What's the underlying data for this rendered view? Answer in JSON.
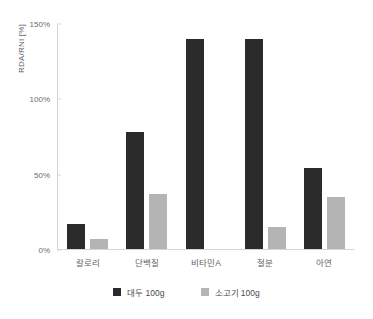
{
  "chart_data": {
    "type": "bar",
    "title": "",
    "subtitle": "",
    "xlabel": "",
    "ylabel": "RDA/RNI [%]",
    "categories": [
      "칼로리",
      "단백질",
      "비타민A",
      "철분",
      "아연"
    ],
    "series": [
      {
        "name": "대두 100g",
        "color": "#2b2b2b",
        "values": [
          17,
          78,
          140,
          140,
          54
        ]
      },
      {
        "name": "소고기 100g",
        "color": "#b4b4b4",
        "values": [
          7,
          37,
          0,
          15,
          35
        ]
      }
    ],
    "ylim": [
      0,
      150
    ],
    "yticks": [
      0,
      50,
      100,
      150
    ],
    "ytick_labels": [
      "0%",
      "50%",
      "100%",
      "150%"
    ],
    "grid": false,
    "legend_position": "bottom"
  },
  "axis": {
    "y_title": "RDA/RNI [%]"
  }
}
